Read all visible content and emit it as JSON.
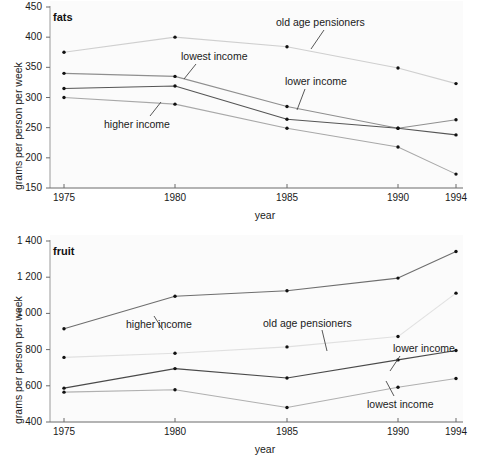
{
  "chart_data": [
    {
      "type": "line",
      "title": "fats",
      "xlabel": "year",
      "ylabel": "grams per person per week",
      "x": [
        1975,
        1980,
        1985,
        1990,
        1994
      ],
      "xticklabels": [
        "1975",
        "1980",
        "1985",
        "1990",
        "1994"
      ],
      "yticks": [
        150,
        200,
        250,
        300,
        350,
        400,
        450
      ],
      "yticklabels": [
        "150",
        "200",
        "250",
        "300",
        "350",
        "400",
        "450"
      ],
      "ylim": [
        150,
        450
      ],
      "grid": false,
      "legend": "inline-annotations",
      "series": [
        {
          "name": "old age pensioners",
          "values": [
            375,
            400,
            384,
            349,
            323
          ],
          "color": "#cfcfcf"
        },
        {
          "name": "lowest income",
          "values": [
            340,
            335,
            285,
            249,
            263
          ],
          "color": "#8f8f8f"
        },
        {
          "name": "lower income",
          "values": [
            315,
            319,
            264,
            249,
            238
          ],
          "color": "#555555"
        },
        {
          "name": "higher income",
          "values": [
            300,
            289,
            249,
            218,
            173
          ],
          "color": "#a8a8a8"
        }
      ],
      "annotations": [
        {
          "text": "old age pensioners",
          "series": "old age pensioners"
        },
        {
          "text": "lowest income",
          "series": "lowest income"
        },
        {
          "text": "lower income",
          "series": "lower income"
        },
        {
          "text": "higher income",
          "series": "higher income"
        }
      ]
    },
    {
      "type": "line",
      "title": "fruit",
      "xlabel": "year",
      "ylabel": "grams per person per week",
      "x": [
        1975,
        1980,
        1985,
        1990,
        1994
      ],
      "xticklabels": [
        "1975",
        "1980",
        "1985",
        "1990",
        "1994"
      ],
      "yticks": [
        400,
        600,
        800,
        1000,
        1200,
        1400
      ],
      "yticklabels": [
        "400",
        "600",
        "800",
        "1 000",
        "1 200",
        "1 400"
      ],
      "ylim": [
        400,
        1400
      ],
      "grid": false,
      "legend": "inline-annotations",
      "series": [
        {
          "name": "higher income",
          "values": [
            915,
            1095,
            1125,
            1195,
            1342
          ],
          "color": "#6e6e6e"
        },
        {
          "name": "old age pensioners",
          "values": [
            757,
            780,
            815,
            872,
            1112
          ],
          "color": "#e0e0e0"
        },
        {
          "name": "lower income",
          "values": [
            587,
            695,
            643,
            743,
            795
          ],
          "color": "#4a4a4a"
        },
        {
          "name": "lowest income",
          "values": [
            565,
            578,
            480,
            592,
            640
          ],
          "color": "#b0b0b0"
        }
      ],
      "annotations": [
        {
          "text": "higher income",
          "series": "higher income"
        },
        {
          "text": "old age pensioners",
          "series": "old age pensioners"
        },
        {
          "text": "lower income",
          "series": "lower income"
        },
        {
          "text": "lowest income",
          "series": "lowest income"
        }
      ]
    }
  ],
  "fats": {
    "title": "fats",
    "xlabel": "year",
    "ylabel": "grams per person per week",
    "labels": {
      "old_age_pensioners": "old age pensioners",
      "lowest_income": "lowest income",
      "lower_income": "lower income",
      "higher_income": "higher income"
    }
  },
  "fruit": {
    "title": "fruit",
    "xlabel": "year",
    "ylabel": "grams per person per week",
    "labels": {
      "higher_income": "higher income",
      "old_age_pensioners": "old age pensioners",
      "lower_income": "lower income",
      "lowest_income": "lowest income"
    }
  }
}
